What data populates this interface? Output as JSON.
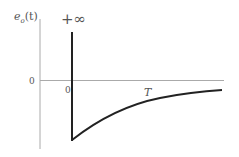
{
  "diagram": {
    "y_axis_label": "e",
    "y_axis_label_sub": "o",
    "y_axis_label_arg": "(t)",
    "spike_label": "+∞",
    "y_zero_label": "0",
    "x_zero_label": "0",
    "time_constant_label": "T",
    "colors": {
      "axis": "#aaaaaa",
      "curve": "#222222",
      "text": "#555555"
    }
  }
}
